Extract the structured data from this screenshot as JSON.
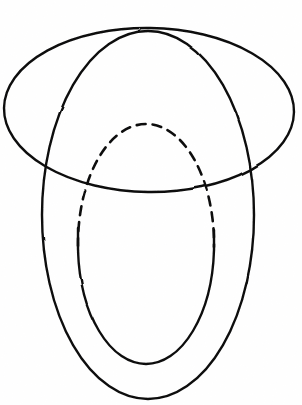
{
  "figure": {
    "title": "Hand-drawn sphere with equatorial and meridian circles",
    "caption": "",
    "background_color": "#ffffff",
    "ink_color": "#111111",
    "canvas": {
      "width": 302,
      "height": 405
    },
    "strokes": [
      {
        "name": "horizontal-ellipse",
        "role": "equator-circle-outer-horizontal",
        "style": "solid",
        "stroke_width": 2.4,
        "center": {
          "cx": 149,
          "cy": 110
        },
        "radii": {
          "rx": 145,
          "ry": 82
        },
        "rotation_deg": 0.8,
        "extremes": {
          "left_x": 4,
          "right_x": 294,
          "top_y": 28,
          "bottom_y": 192
        }
      },
      {
        "name": "outer-vertical-ellipse",
        "role": "meridian-circle-outer-vertical",
        "style": "solid",
        "stroke_width": 2.4,
        "center": {
          "cx": 148,
          "cy": 215
        },
        "radii": {
          "rx": 106,
          "ry": 184
        },
        "rotation_deg": 0,
        "extremes": {
          "left_x": 42,
          "right_x": 254,
          "top_y": 31,
          "bottom_y": 399
        }
      },
      {
        "name": "inner-ellipse-visible-arc",
        "role": "inner-meridian-front-solid",
        "style": "solid",
        "stroke_width": 2.4,
        "center": {
          "cx": 146,
          "cy": 244
        },
        "radii": {
          "rx": 68,
          "ry": 120
        },
        "rotation_deg": 0,
        "extremes": {
          "left_x": 78,
          "right_x": 214,
          "top_y": 124,
          "bottom_y": 364
        }
      },
      {
        "name": "inner-ellipse-hidden-arc",
        "role": "inner-meridian-back-dashed",
        "style": "dashed",
        "dash_pattern": "9 7",
        "stroke_width": 2.6,
        "arc_from_deg": 190,
        "arc_to_deg": 350,
        "transition_y_left": 228,
        "transition_y_right": 230
      }
    ],
    "intersections": [
      {
        "name": "left-crossing",
        "x": 45,
        "y": 175
      },
      {
        "name": "right-crossing",
        "x": 253,
        "y": 168
      },
      {
        "name": "top-crossing",
        "x": 136,
        "y": 30
      }
    ]
  }
}
